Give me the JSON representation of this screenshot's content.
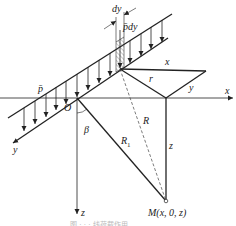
{
  "diagram": {
    "type": "geometry-load-figure",
    "labels": {
      "dy": "dy",
      "p_dy": "p̄dy",
      "p_bar": "p̄",
      "x_top": "x",
      "r": "r",
      "y_small": "y",
      "x_axis": "x",
      "O": "O",
      "y_axis": "y",
      "beta": "β",
      "R1": "R",
      "R1_sub": "1",
      "R": "R",
      "z_line": "z",
      "z_axis": "z",
      "M": "M(x, 0, z)"
    },
    "caption": "图 · · · 线荷载作用"
  }
}
